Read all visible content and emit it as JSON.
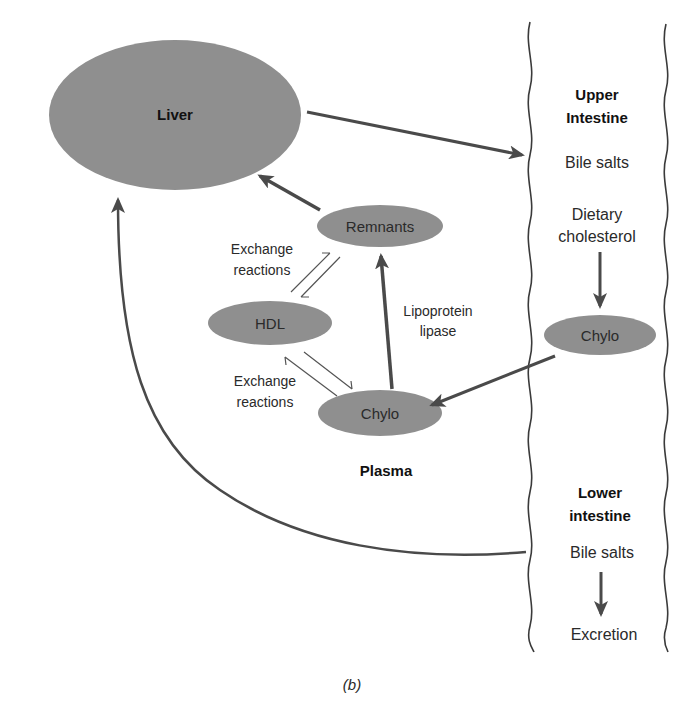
{
  "diagram": {
    "nodes": {
      "liver": "Liver",
      "remnants": "Remnants",
      "hdl": "HDL",
      "chylo_plasma": "Chylo",
      "chylo_intestine": "Chylo"
    },
    "labels": {
      "exchange_top_1": "Exchange",
      "exchange_top_2": "reactions",
      "exchange_bottom_1": "Exchange",
      "exchange_bottom_2": "reactions",
      "lipoprotein_1": "Lipoprotein",
      "lipoprotein_2": "lipase",
      "plasma": "Plasma"
    },
    "intestine": {
      "upper_title_1": "Upper",
      "upper_title_2": "Intestine",
      "upper_bile_salts": "Bile salts",
      "dietary_1": "Dietary",
      "dietary_2": "cholesterol",
      "lower_title_1": "Lower",
      "lower_title_2": "intestine",
      "lower_bile_salts": "Bile salts",
      "excretion": "Excretion"
    },
    "caption": "(b)",
    "colors": {
      "node_fill": "#8f8f8f",
      "arrow": "#4a4a4a",
      "text": "#2a2a2a"
    }
  }
}
